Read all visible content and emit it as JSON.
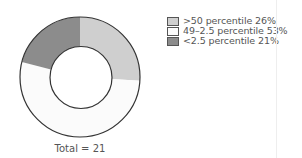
{
  "chart_data": {
    "type": "pie",
    "variant": "donut",
    "title": "",
    "slices": [
      {
        "label": ">50 percentile",
        "percent": 26,
        "color": "#cfcfcf"
      },
      {
        "label": "49–2.5 percentile",
        "percent": 53,
        "color": "#fbfbfb"
      },
      {
        "label": "<2.5 percentile",
        "percent": 21,
        "color": "#8c8c8c"
      }
    ],
    "total_label": "Total = 21",
    "total": 21,
    "legend_position": "right",
    "start_angle_deg": 0,
    "direction": "clockwise"
  },
  "legend": {
    "items": [
      {
        "label": ">50 percentile 26%",
        "color": "#cfcfcf"
      },
      {
        "label": "49–2.5 percentile 53%",
        "color": "#fbfbfb"
      },
      {
        "label": "<2.5 percentile 21%",
        "color": "#8c8c8c"
      }
    ]
  },
  "footer": {
    "total_text": "Total = 21"
  },
  "colors": {
    "outline": "#333333",
    "text": "#555555"
  }
}
